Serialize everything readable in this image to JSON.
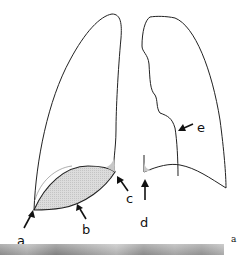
{
  "figure": {
    "panel_label": "a",
    "labels": {
      "a": "a",
      "b": "b",
      "c": "c",
      "d": "d",
      "e": "e"
    },
    "colors": {
      "outline": "#222222",
      "shading": "#d6d6d6",
      "arrow": "#111111",
      "xray": "#a6a6a6"
    }
  }
}
